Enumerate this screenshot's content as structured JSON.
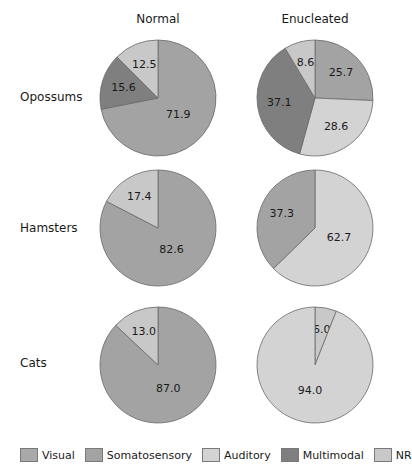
{
  "columns": [
    "Normal",
    "Enucleated"
  ],
  "rows": [
    "Opossums",
    "Hamsters",
    "Cats"
  ],
  "legend": [
    {
      "name": "Visual",
      "color": "#a9a9a9"
    },
    {
      "name": "Somatosensory",
      "color": "#a3a3a3"
    },
    {
      "name": "Auditory",
      "color": "#d3d3d3"
    },
    {
      "name": "Multimodal",
      "color": "#7f7f7f"
    },
    {
      "name": "NR",
      "color": "#c8c8c8"
    }
  ],
  "chart_data": {
    "type": "pie",
    "title": "",
    "columns": [
      "Normal",
      "Enucleated"
    ],
    "rows": [
      "Opossums",
      "Hamsters",
      "Cats"
    ],
    "legend": [
      "Visual",
      "Somatosensory",
      "Auditory",
      "Multimodal",
      "NR"
    ],
    "pies": [
      {
        "row": "Opossums",
        "column": "Normal",
        "slices": [
          {
            "category": "Somatosensory",
            "value": 71.9
          },
          {
            "category": "Multimodal",
            "value": 15.6
          },
          {
            "category": "NR",
            "value": 12.5
          }
        ]
      },
      {
        "row": "Opossums",
        "column": "Enucleated",
        "slices": [
          {
            "category": "Somatosensory",
            "value": 25.7
          },
          {
            "category": "Auditory",
            "value": 28.6
          },
          {
            "category": "Multimodal",
            "value": 37.1
          },
          {
            "category": "NR",
            "value": 8.6
          }
        ]
      },
      {
        "row": "Hamsters",
        "column": "Normal",
        "slices": [
          {
            "category": "Somatosensory",
            "value": 82.6
          },
          {
            "category": "NR",
            "value": 17.4
          }
        ]
      },
      {
        "row": "Hamsters",
        "column": "Enucleated",
        "slices": [
          {
            "category": "Auditory",
            "value": 62.7
          },
          {
            "category": "Somatosensory",
            "value": 37.3
          }
        ]
      },
      {
        "row": "Cats",
        "column": "Normal",
        "slices": [
          {
            "category": "Somatosensory",
            "value": 87.0
          },
          {
            "category": "NR",
            "value": 13.0
          }
        ]
      },
      {
        "row": "Cats",
        "column": "Enucleated",
        "slices": [
          {
            "category": "NR",
            "value": 6.0
          },
          {
            "category": "Auditory",
            "value": 94.0
          }
        ]
      }
    ]
  },
  "layout": {
    "col_x": [
      158,
      315
    ],
    "row_y": [
      98,
      228,
      365
    ],
    "radius": 58
  }
}
